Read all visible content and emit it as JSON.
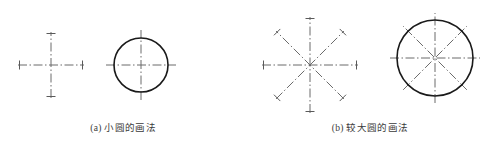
{
  "figure": {
    "background_color": "#ffffff",
    "width": 493,
    "height": 150,
    "centerline_color": "#6b6b6b",
    "circle_color": "#1a1a1a",
    "tick_color": "#5a5a5a",
    "caption_color": "#3a3a3a",
    "centerline_dash_pattern": "9 2.5 1.5 2.5",
    "centerline_width": 1,
    "circle_width": 1.6
  },
  "panels": [
    {
      "id": "panel-a",
      "caption": "(a) 小圆的画法",
      "caption_label": "(a)",
      "caption_text": "小圆的画法",
      "steps": [
        {
          "id": "small-circle-centerlines",
          "kind": "centerline-cross",
          "center": [
            51,
            65
          ],
          "axes": 2,
          "half_length": 33,
          "tick_half_length": 4.5,
          "tick_inset": 1.5,
          "angles_deg": [
            0,
            90
          ]
        },
        {
          "id": "small-circle-drawn",
          "kind": "circle-with-centerlines",
          "center": [
            141,
            65
          ],
          "radius": 27,
          "half_length": 35,
          "axes": 2,
          "angles_deg": [
            0,
            90
          ]
        }
      ]
    },
    {
      "id": "panel-b",
      "caption": "(b) 较大圆的画法",
      "caption_label": "(b)",
      "caption_text": "较大圆的画法",
      "steps": [
        {
          "id": "large-circle-centerlines",
          "kind": "centerline-star",
          "center": [
            310,
            65
          ],
          "axes": 4,
          "half_length": 48,
          "tick_half_length": 4.5,
          "tick_inset": 1.5,
          "angles_deg": [
            0,
            45,
            90,
            135
          ]
        },
        {
          "id": "large-circle-drawn",
          "kind": "circle-with-star",
          "center": [
            435,
            58
          ],
          "radius": 38,
          "half_length": 45,
          "axes": 4,
          "angles_deg": [
            0,
            45,
            90,
            135
          ]
        }
      ]
    }
  ]
}
